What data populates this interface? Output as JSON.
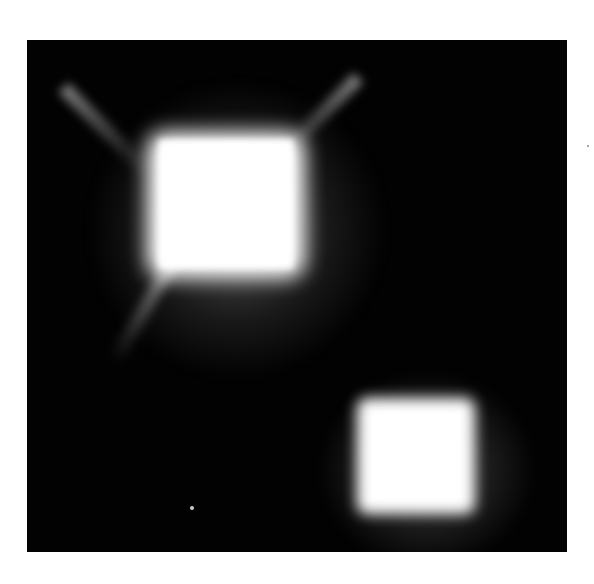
{
  "image": {
    "description": "Two bright square-shaped glowing spots on a black background",
    "background_color": "#020202",
    "page_color": "#ffffff",
    "spots": [
      {
        "name": "large-spot",
        "center": [
          225,
          185
        ],
        "size": [
          158,
          146
        ]
      },
      {
        "name": "small-spot",
        "center": [
          413,
          455
        ],
        "size": [
          118,
          116
        ]
      }
    ]
  }
}
